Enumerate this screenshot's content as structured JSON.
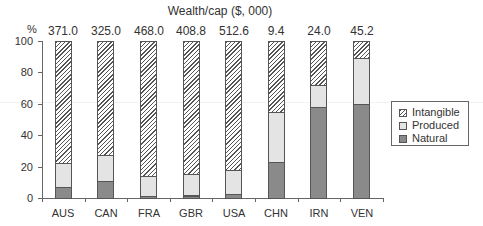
{
  "chart_data": {
    "type": "bar",
    "stacked": true,
    "title": "Wealth/cap ($, 000)",
    "ylabel": "%",
    "xlabel": "",
    "ylim": [
      0,
      100
    ],
    "yticks": [
      "0",
      "20",
      "40",
      "60",
      "80",
      "100"
    ],
    "categories": [
      "AUS",
      "CAN",
      "FRA",
      "GBR",
      "USA",
      "CHN",
      "IRN",
      "VEN"
    ],
    "wealth_per_capita_labels": [
      "371.0",
      "325.0",
      "468.0",
      "408.8",
      "512.6",
      "9.4",
      "24.0",
      "45.2"
    ],
    "series": [
      {
        "name": "Natural",
        "color": "#8a8a8a",
        "values": [
          7,
          11,
          1.5,
          1.5,
          3,
          23,
          58,
          60
        ]
      },
      {
        "name": "Produced",
        "color": "#e4e4e4",
        "values": [
          15,
          16.5,
          12.5,
          13.5,
          15,
          32,
          14,
          29
        ]
      },
      {
        "name": "Intangible",
        "pattern": "hatched",
        "values": [
          78,
          72.5,
          86,
          85,
          82,
          45,
          28,
          11
        ]
      }
    ],
    "legend": {
      "position": "right",
      "entries": [
        "Intangible",
        "Produced",
        "Natural"
      ]
    },
    "grid": false
  }
}
